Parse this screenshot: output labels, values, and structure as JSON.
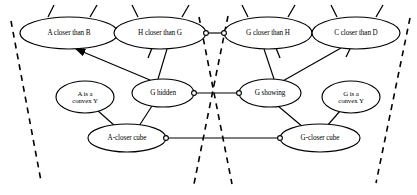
{
  "diagram": {
    "type": "node-link-graph",
    "width": 417,
    "height": 195,
    "background_color": "#ffffff",
    "line_color": "#000000",
    "nodes": [
      {
        "id": "a-closer-than-b",
        "label": "A closer than B",
        "lines": [
          "A closer than B"
        ],
        "cx": 69,
        "cy": 33,
        "rx": 49,
        "ry": 16
      },
      {
        "id": "h-closer-than-g",
        "label": "H closer than G",
        "lines": [
          "H closer than G"
        ],
        "cx": 160,
        "cy": 33,
        "rx": 46,
        "ry": 16
      },
      {
        "id": "g-closer-than-h",
        "label": "G closer than H",
        "lines": [
          "G closer than H"
        ],
        "cx": 268,
        "cy": 33,
        "rx": 44,
        "ry": 16
      },
      {
        "id": "c-closer-than-d",
        "label": "C closer than D",
        "lines": [
          "C closer than D"
        ],
        "cx": 356,
        "cy": 33,
        "rx": 44,
        "ry": 16
      },
      {
        "id": "a-is-a-convex-y",
        "label": "A is a convex Y",
        "lines": [
          "A is a",
          "convex Y"
        ],
        "cx": 85,
        "cy": 97,
        "rx": 29,
        "ry": 16
      },
      {
        "id": "g-hidden",
        "label": "G hidden",
        "lines": [
          "G hidden"
        ],
        "cx": 163,
        "cy": 93,
        "rx": 31,
        "ry": 14
      },
      {
        "id": "g-showing",
        "label": "G showing",
        "lines": [
          "G showing"
        ],
        "cx": 270,
        "cy": 93,
        "rx": 31,
        "ry": 14
      },
      {
        "id": "g-is-a-convex-y",
        "label": "G is a convex Y",
        "lines": [
          "G is a",
          "convex Y"
        ],
        "cx": 351,
        "cy": 97,
        "rx": 29,
        "ry": 16
      },
      {
        "id": "a-closer-cube",
        "label": "A-closer cube",
        "lines": [
          "A-closer cube"
        ],
        "cx": 127,
        "cy": 138,
        "rx": 39,
        "ry": 14
      },
      {
        "id": "g-closer-cube",
        "label": "G-closer cube",
        "lines": [
          "G-closer cube"
        ],
        "cx": 320,
        "cy": 138,
        "rx": 40,
        "ry": 14
      }
    ],
    "edges": [
      {
        "id": "edge-ab-hg",
        "from": "a-closer-than-b",
        "to": "h-closer-than-g",
        "x1": 118,
        "y1": 33,
        "x2": 114,
        "y2": 33
      },
      {
        "id": "edge-hg-gh",
        "from": "h-closer-than-g",
        "to": "g-closer-than-h",
        "x1": 206,
        "y1": 33,
        "x2": 224,
        "y2": 33,
        "port_start": true,
        "port_end": true
      },
      {
        "id": "edge-gh-cd",
        "from": "g-closer-than-h",
        "to": "c-closer-than-d",
        "x1": 312,
        "y1": 33,
        "x2": 312,
        "y2": 33
      },
      {
        "id": "edge-hg-ghidden",
        "from": "h-closer-than-g",
        "to": "g-hidden",
        "x1": 167,
        "y1": 49,
        "x2": 158,
        "y2": 79
      },
      {
        "id": "edge-ghidden-ab",
        "from": "g-hidden",
        "to": "a-closer-than-b",
        "x1": 150,
        "y1": 80,
        "x2": 76,
        "y2": 49,
        "arrow": true
      },
      {
        "id": "edge-ghidden-gshowing",
        "from": "g-hidden",
        "to": "g-showing",
        "x1": 194,
        "y1": 93,
        "x2": 239,
        "y2": 93,
        "port_start": true,
        "port_end": true
      },
      {
        "id": "edge-gh-gshowing",
        "from": "g-closer-than-h",
        "to": "g-showing",
        "x1": 264,
        "y1": 49,
        "x2": 274,
        "y2": 79
      },
      {
        "id": "edge-cd-gshowing",
        "from": "c-closer-than-d",
        "to": "g-showing",
        "x1": 341,
        "y1": 48,
        "x2": 281,
        "y2": 82
      },
      {
        "id": "edge-aconvex-acube",
        "from": "a-is-a-convex-y",
        "to": "a-closer-cube",
        "x1": 97,
        "y1": 110,
        "x2": 115,
        "y2": 126
      },
      {
        "id": "edge-ghidden-acube",
        "from": "g-hidden",
        "to": "a-closer-cube",
        "x1": 152,
        "y1": 106,
        "x2": 139,
        "y2": 126
      },
      {
        "id": "edge-acube-gcube",
        "from": "a-closer-cube",
        "to": "g-closer-cube",
        "x1": 166,
        "y1": 138,
        "x2": 280,
        "y2": 138,
        "port_start": true,
        "port_end": true
      },
      {
        "id": "edge-gshowing-gcube",
        "from": "g-showing",
        "to": "g-closer-cube",
        "x1": 278,
        "y1": 106,
        "x2": 303,
        "y2": 127
      },
      {
        "id": "edge-gconvex-gcube",
        "from": "g-is-a-convex-y",
        "to": "g-closer-cube",
        "x1": 340,
        "y1": 111,
        "x2": 327,
        "y2": 126
      }
    ],
    "stubs": [
      {
        "id": "stub-ab-left",
        "x1": 48,
        "y1": 17,
        "x2": 54,
        "y2": 5
      },
      {
        "id": "stub-ab-right",
        "x1": 90,
        "y1": 17,
        "x2": 97,
        "y2": 5
      },
      {
        "id": "stub-hg-left",
        "x1": 138,
        "y1": 17,
        "x2": 132,
        "y2": 5
      },
      {
        "id": "stub-hg-right",
        "x1": 182,
        "y1": 17,
        "x2": 189,
        "y2": 5
      },
      {
        "id": "stub-gh-left",
        "x1": 248,
        "y1": 17,
        "x2": 242,
        "y2": 5
      },
      {
        "id": "stub-gh-right",
        "x1": 288,
        "y1": 17,
        "x2": 295,
        "y2": 5
      },
      {
        "id": "stub-cd-left",
        "x1": 337,
        "y1": 17,
        "x2": 331,
        "y2": 5
      },
      {
        "id": "stub-cd-right",
        "x1": 376,
        "y1": 17,
        "x2": 383,
        "y2": 5
      },
      {
        "id": "stub-hg-bottom",
        "x1": 152,
        "y1": 48,
        "x2": 148,
        "y2": 58
      },
      {
        "id": "stub-gh-bottom",
        "x1": 276,
        "y1": 48,
        "x2": 280,
        "y2": 58
      },
      {
        "id": "stub-cd-bottom",
        "x1": 350,
        "y1": 49,
        "x2": 346,
        "y2": 57
      }
    ],
    "cut_lines": [
      {
        "id": "cut-line-left",
        "x1": 11,
        "y1": 21,
        "x2": 41,
        "y2": 181
      },
      {
        "id": "cut-line-mid-left",
        "x1": 199,
        "y1": 17,
        "x2": 232,
        "y2": 184
      },
      {
        "id": "cut-line-mid-right",
        "x1": 228,
        "y1": 16,
        "x2": 194,
        "y2": 184
      },
      {
        "id": "cut-line-right",
        "x1": 410,
        "y1": 18,
        "x2": 376,
        "y2": 183
      }
    ]
  }
}
